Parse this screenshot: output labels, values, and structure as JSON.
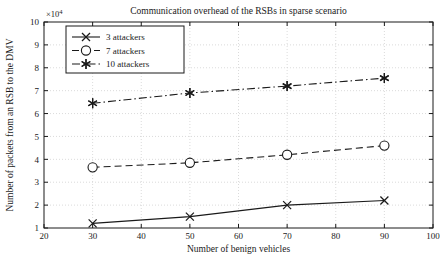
{
  "chart_data": {
    "type": "line",
    "title": "Communication overhead of the RSBs in sparse scenario",
    "xlabel": "Number of benign vehicles",
    "ylabel": "Number of packets from an RSB to the DMV",
    "y_exponent": "×10",
    "y_exponent_power": "4",
    "xlim": [
      20,
      100
    ],
    "ylim": [
      1,
      10
    ],
    "xticks": [
      20,
      30,
      40,
      50,
      60,
      70,
      80,
      90,
      100
    ],
    "yticks": [
      1,
      2,
      3,
      4,
      5,
      6,
      7,
      8,
      9,
      10
    ],
    "grid": true,
    "legend_position": "upper-left",
    "x": [
      30,
      50,
      70,
      90
    ],
    "series": [
      {
        "name": "3 attackers",
        "marker": "x",
        "dash": "solid",
        "values": [
          1.2,
          1.5,
          2.0,
          2.2
        ]
      },
      {
        "name": "7 attackers",
        "marker": "circle",
        "dash": "dashed",
        "values": [
          3.65,
          3.85,
          4.2,
          4.6
        ]
      },
      {
        "name": "10 attackers",
        "marker": "star",
        "dash": "dashdot",
        "values": [
          6.45,
          6.9,
          7.2,
          7.55
        ]
      }
    ]
  },
  "style": {
    "line_color": "#1a1a1a",
    "grid_color": "#cccccc",
    "axis_color": "#1a1a1a",
    "background": "#ffffff"
  }
}
